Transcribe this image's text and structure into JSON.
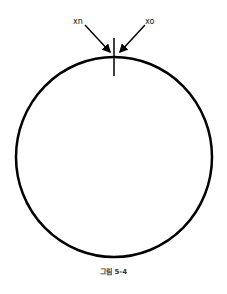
{
  "figure": {
    "labels": {
      "left_arrow": "xn",
      "right_arrow": "xo"
    },
    "caption": "그림 5-4",
    "colors": {
      "stroke": "#000000",
      "background": "#ffffff"
    }
  }
}
